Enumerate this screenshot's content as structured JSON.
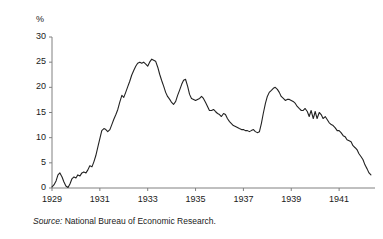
{
  "figure": {
    "background": "#ffffff",
    "line_color": "#222222",
    "axis_color": "#808080",
    "text_color": "#1a1a1a"
  },
  "source_note": {
    "label": "Source:",
    "text": "National Bureau of Economic Research."
  },
  "chart_data": {
    "type": "line",
    "title": "",
    "xlabel": "",
    "ylabel": "%",
    "ylim": [
      0,
      30
    ],
    "xlim": [
      1929.0,
      1942.5
    ],
    "grid": false,
    "legend": null,
    "ytick_labels": [
      "0",
      "5",
      "10",
      "15",
      "20",
      "25",
      "30"
    ],
    "yticks": [
      0,
      5,
      10,
      15,
      20,
      25,
      30
    ],
    "xtick_labels": [
      "1929",
      "1931",
      "1933",
      "1935",
      "1937",
      "1939",
      "1941"
    ],
    "xticks": [
      1929,
      1931,
      1933,
      1935,
      1937,
      1939,
      1941
    ],
    "series": [
      {
        "name": "Unemployment rate",
        "x": [
          1929.0,
          1929.08,
          1929.17,
          1929.25,
          1929.33,
          1929.42,
          1929.5,
          1929.58,
          1929.67,
          1929.75,
          1929.83,
          1929.92,
          1930.0,
          1930.08,
          1930.17,
          1930.25,
          1930.33,
          1930.42,
          1930.5,
          1930.58,
          1930.67,
          1930.75,
          1930.83,
          1930.92,
          1931.0,
          1931.08,
          1931.17,
          1931.25,
          1931.33,
          1931.42,
          1931.5,
          1931.58,
          1931.67,
          1931.75,
          1931.83,
          1931.92,
          1932.0,
          1932.08,
          1932.17,
          1932.25,
          1932.33,
          1932.42,
          1932.5,
          1932.58,
          1932.67,
          1932.75,
          1932.83,
          1932.92,
          1933.0,
          1933.08,
          1933.17,
          1933.25,
          1933.33,
          1933.42,
          1933.5,
          1933.58,
          1933.67,
          1933.75,
          1933.83,
          1933.92,
          1934.0,
          1934.08,
          1934.17,
          1934.25,
          1934.33,
          1934.42,
          1934.5,
          1934.58,
          1934.67,
          1934.75,
          1934.83,
          1934.92,
          1935.0,
          1935.08,
          1935.17,
          1935.25,
          1935.33,
          1935.42,
          1935.5,
          1935.58,
          1935.67,
          1935.75,
          1935.83,
          1935.92,
          1936.0,
          1936.08,
          1936.17,
          1936.25,
          1936.33,
          1936.42,
          1936.5,
          1936.58,
          1936.67,
          1936.75,
          1936.83,
          1936.92,
          1937.0,
          1937.08,
          1937.17,
          1937.25,
          1937.33,
          1937.42,
          1937.5,
          1937.58,
          1937.67,
          1937.75,
          1937.83,
          1937.92,
          1938.0,
          1938.08,
          1938.17,
          1938.25,
          1938.33,
          1938.42,
          1938.5,
          1938.58,
          1938.67,
          1938.75,
          1938.83,
          1938.92,
          1939.0,
          1939.08,
          1939.17,
          1939.25,
          1939.33,
          1939.42,
          1939.5,
          1939.58,
          1939.67,
          1939.75,
          1939.83,
          1939.92,
          1940.0,
          1940.08,
          1940.17,
          1940.25,
          1940.33,
          1940.42,
          1940.5,
          1940.58,
          1940.67,
          1940.75,
          1940.83,
          1940.92,
          1941.0,
          1941.08,
          1941.17,
          1941.25,
          1941.33,
          1941.42,
          1941.5,
          1941.58,
          1941.67,
          1941.75,
          1941.83,
          1941.92,
          1942.0,
          1942.08,
          1942.17,
          1942.25,
          1942.33
        ],
        "values": [
          0.2,
          0.6,
          1.4,
          2.6,
          3.0,
          2.2,
          1.2,
          0.4,
          0.1,
          0.8,
          1.8,
          2.2,
          2.0,
          2.6,
          2.4,
          3.0,
          3.2,
          3.0,
          3.6,
          4.4,
          4.2,
          5.2,
          6.4,
          8.2,
          9.8,
          11.4,
          11.8,
          11.6,
          11.2,
          11.6,
          12.6,
          13.6,
          14.6,
          15.6,
          17.0,
          18.4,
          18.0,
          19.0,
          20.2,
          21.2,
          22.4,
          23.4,
          24.2,
          24.8,
          25.0,
          24.8,
          25.0,
          24.6,
          24.2,
          25.0,
          25.6,
          25.4,
          25.2,
          24.0,
          22.6,
          21.4,
          20.2,
          19.0,
          18.2,
          17.6,
          17.0,
          16.6,
          17.2,
          18.4,
          19.4,
          20.6,
          21.4,
          21.6,
          20.2,
          18.6,
          17.8,
          17.6,
          17.4,
          17.6,
          17.8,
          18.2,
          17.8,
          17.0,
          16.2,
          15.4,
          15.4,
          15.6,
          15.2,
          14.8,
          14.6,
          14.2,
          14.8,
          14.6,
          13.8,
          13.2,
          12.8,
          12.4,
          12.2,
          12.0,
          11.8,
          11.6,
          11.6,
          11.4,
          11.4,
          11.2,
          11.4,
          11.6,
          11.2,
          11.0,
          11.2,
          12.8,
          14.8,
          16.8,
          18.2,
          19.0,
          19.4,
          19.8,
          20.0,
          19.6,
          19.0,
          18.2,
          17.8,
          17.4,
          17.6,
          17.6,
          17.4,
          17.2,
          16.8,
          16.2,
          15.8,
          15.4,
          15.4,
          15.8,
          15.2,
          14.2,
          15.4,
          13.8,
          15.2,
          13.8,
          15.0,
          14.6,
          13.8,
          14.2,
          13.6,
          13.0,
          12.6,
          12.4,
          12.0,
          11.4,
          11.4,
          11.0,
          10.4,
          10.2,
          9.6,
          9.4,
          9.2,
          8.4,
          8.0,
          7.6,
          6.8,
          6.2,
          5.6,
          4.6,
          3.8,
          3.0,
          2.6
        ]
      }
    ]
  }
}
